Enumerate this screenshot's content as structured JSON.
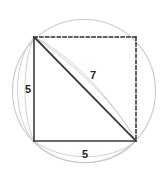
{
  "figure": {
    "canvas": {
      "width": 162,
      "height": 179,
      "background": "#ffffff"
    },
    "colors": {
      "circle_stroke": "#c9c9c9",
      "solid_stroke": "#3a3a3a",
      "dashed_stroke": "#2e2e2e",
      "arc_stroke": "#c9c9c9",
      "label_fill": "#262626"
    },
    "circle": {
      "name": "circumscribed-circle",
      "cx": 84,
      "cy": 91,
      "r": 71.5,
      "stroke_width": 1.1,
      "dash": "none"
    },
    "square": {
      "name": "square",
      "top_left": {
        "x": 34,
        "y": 37
      },
      "top_right": {
        "x": 136,
        "y": 37
      },
      "bottom_right": {
        "x": 136,
        "y": 141
      },
      "bottom_left": {
        "x": 34,
        "y": 141
      }
    },
    "edges": [
      {
        "name": "left-side",
        "style": "solid",
        "x1": 34,
        "y1": 37,
        "x2": 34,
        "y2": 141,
        "stroke_width": 1.6,
        "label": "5"
      },
      {
        "name": "bottom-side",
        "style": "solid",
        "x1": 34,
        "y1": 141,
        "x2": 136,
        "y2": 141,
        "stroke_width": 1.6,
        "label": "5"
      },
      {
        "name": "top-side",
        "style": "dashed",
        "x1": 34,
        "y1": 37,
        "x2": 136,
        "y2": 37,
        "stroke_width": 1.5,
        "dasharray": "3.2,2.6",
        "label": ""
      },
      {
        "name": "right-side",
        "style": "dashed",
        "x1": 136,
        "y1": 37,
        "x2": 136,
        "y2": 141,
        "stroke_width": 1.5,
        "dasharray": "3.2,2.6",
        "label": ""
      },
      {
        "name": "diagonal-hypotenuse",
        "style": "solid",
        "x1": 34,
        "y1": 37,
        "x2": 136,
        "y2": 141,
        "stroke_width": 1.8,
        "label": "7"
      }
    ],
    "measure_arcs": [
      {
        "name": "left-measure-arc-outer",
        "path": "M 34 37 C 12 62 12 118 34 141"
      },
      {
        "name": "left-measure-arc-inner",
        "path": "M 34 37 C 22 64 22 116 34 141"
      },
      {
        "name": "bottom-measure-arc-outer",
        "path": "M 34 141 C 60 170 112 170 136 141"
      },
      {
        "name": "bottom-measure-arc-inner",
        "path": "M 34 141 C 62 162 110 162 136 141"
      },
      {
        "name": "diagonal-measure-arc-upper",
        "path": "M 34 37 C 66 52 112 97 136 141"
      },
      {
        "name": "diagonal-measure-arc-lower",
        "path": "M 34 37 C 74 63 118 106 136 141"
      }
    ],
    "labels": [
      {
        "name": "label-left-side",
        "text": "5",
        "x": 28,
        "y": 93,
        "font_size": 11,
        "anchor": "middle"
      },
      {
        "name": "label-bottom-side",
        "text": "5",
        "x": 85,
        "y": 158,
        "font_size": 11,
        "anchor": "middle"
      },
      {
        "name": "label-diagonal",
        "text": "7",
        "x": 93,
        "y": 79,
        "font_size": 11,
        "anchor": "middle"
      }
    ]
  }
}
